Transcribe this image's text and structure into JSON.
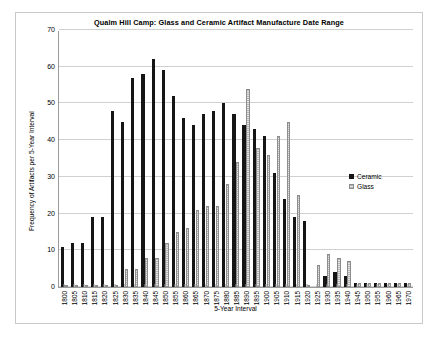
{
  "chart_data": {
    "type": "bar",
    "title": "Qualm Hill Camp: Glass and Ceramic Artifact Manufacture Date Range",
    "xlabel": "5-Year Interval",
    "ylabel": "Frequency of Artifacts per 5-Year Interval",
    "ylim": [
      0,
      70
    ],
    "ytick_step": 10,
    "yticks": [
      0,
      10,
      20,
      30,
      40,
      50,
      60,
      70
    ],
    "grid": true,
    "legend_position": "right-middle",
    "categories": [
      "1800",
      "1805",
      "1810",
      "1815",
      "1820",
      "1825",
      "1830",
      "1835",
      "1840",
      "1845",
      "1850",
      "1855",
      "1860",
      "1865",
      "1870",
      "1875",
      "1880",
      "1885",
      "1890",
      "1895",
      "1900",
      "1905",
      "1910",
      "1915",
      "1920",
      "1925",
      "1930",
      "1935",
      "1940",
      "1945",
      "1950",
      "1955",
      "1960",
      "1965",
      "1970"
    ],
    "series": [
      {
        "name": "Ceramic",
        "color": "#151515",
        "values": [
          11,
          12,
          12,
          19,
          19,
          48,
          45,
          57,
          58,
          62,
          59,
          52,
          46,
          44,
          47,
          48,
          50,
          47,
          44,
          43,
          41,
          31,
          24,
          19,
          18,
          0,
          3,
          4,
          3,
          1,
          1,
          1,
          1,
          1,
          1
        ]
      },
      {
        "name": "Glass",
        "color": "#b6b6b6",
        "values": [
          0,
          0,
          0,
          0,
          0,
          0,
          5,
          5,
          8,
          8,
          12,
          15,
          16,
          21,
          22,
          22,
          28,
          34,
          54,
          38,
          36,
          41,
          45,
          25,
          0,
          6,
          9,
          8,
          7,
          1,
          1,
          1,
          1,
          1,
          1
        ]
      }
    ]
  },
  "legend": {
    "items": [
      {
        "label": "Ceramic"
      },
      {
        "label": "Glass"
      }
    ]
  }
}
